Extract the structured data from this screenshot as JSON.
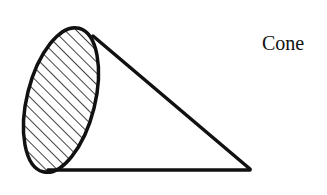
{
  "diagram": {
    "shape": "cone",
    "label": "Cone",
    "stroke_color": "#111111",
    "hatch": "diagonal-lines",
    "base_ellipse": {
      "cx": 61,
      "cy": 100,
      "rx": 35,
      "ry": 75,
      "rotate": 14
    },
    "apex": {
      "x": 250,
      "y": 169
    }
  }
}
